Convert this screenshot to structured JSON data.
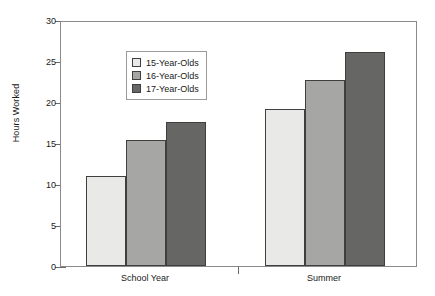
{
  "chart_data": {
    "type": "bar",
    "title": "",
    "xlabel": "",
    "ylabel": "Hours Worked",
    "ylim": [
      0,
      30
    ],
    "ytick_step": 5,
    "yticks": [
      30,
      25,
      20,
      15,
      10,
      5,
      0
    ],
    "ytick_labels": [
      "30",
      "25",
      "20",
      "15",
      "10",
      "5",
      "0"
    ],
    "categories": [
      "School Year",
      "Summer"
    ],
    "grid": false,
    "legend_position": "top-left-inside",
    "series": [
      {
        "name": "15-Year-Olds",
        "color": "#e9e9e7",
        "values": [
          11.0,
          19.1
        ]
      },
      {
        "name": "16-Year-Olds",
        "color": "#a6a6a4",
        "values": [
          15.4,
          22.7
        ]
      },
      {
        "name": "17-Year-Olds",
        "color": "#666664",
        "values": [
          17.6,
          26.1
        ]
      }
    ]
  },
  "legend": {
    "items": [
      {
        "label": "15-Year-Olds"
      },
      {
        "label": "16-Year-Olds"
      },
      {
        "label": "17-Year-Olds"
      }
    ]
  },
  "axes": {
    "y_title": "Hours Worked",
    "y_labels": [
      "30",
      "25",
      "20",
      "15",
      "10",
      "5",
      "0"
    ],
    "x_labels": [
      "School Year",
      "Summer"
    ]
  }
}
